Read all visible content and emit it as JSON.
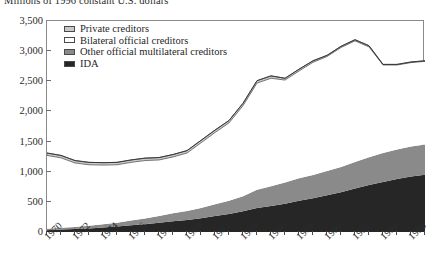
{
  "chart_title": "Millions of 1996 constant U.S. dollars",
  "legend": {
    "items": [
      {
        "label": "Private creditors",
        "color": "#c9c9c9"
      },
      {
        "label": "Bilateral official creditors",
        "color": "#ffffff"
      },
      {
        "label": "Other official multilateral creditors",
        "color": "#8a8a8a"
      },
      {
        "label": "IDA",
        "color": "#262626"
      }
    ]
  },
  "chart_data": {
    "type": "area",
    "stacked": true,
    "title": "Millions of 1996 constant U.S. dollars",
    "xlabel": "",
    "ylabel": "Millions of 1996 constant U.S. dollars",
    "ylim": [
      0,
      3500
    ],
    "ytick_step": 500,
    "grid": false,
    "legend_position": "top-left",
    "xlim": [
      1970,
      1997
    ],
    "x": [
      1970,
      1971,
      1972,
      1973,
      1974,
      1975,
      1976,
      1977,
      1978,
      1979,
      1980,
      1981,
      1982,
      1983,
      1984,
      1985,
      1986,
      1987,
      1988,
      1989,
      1990,
      1991,
      1992,
      1993,
      1994,
      1995,
      1996,
      1997
    ],
    "ytick_labels": [
      "0",
      "500",
      "1,000",
      "1,500",
      "2,000",
      "2,500",
      "3,000",
      "3,500"
    ],
    "ytick_values": [
      0,
      500,
      1000,
      1500,
      2000,
      2500,
      3000,
      3500
    ],
    "xtick_labels": [
      "1970",
      "1972",
      "1974",
      "1976",
      "1978",
      "1980",
      "1982",
      "1984",
      "1986",
      "1988",
      "1990",
      "1992",
      "1994",
      "1996"
    ],
    "xtick_values": [
      1970,
      1972,
      1974,
      1976,
      1978,
      1980,
      1982,
      1984,
      1986,
      1988,
      1990,
      1992,
      1994,
      1996
    ],
    "series": [
      {
        "name": "IDA",
        "color": "#262626",
        "values": [
          30,
          40,
          50,
          60,
          75,
          90,
          110,
          130,
          155,
          180,
          200,
          230,
          265,
          300,
          345,
          400,
          430,
          470,
          520,
          560,
          610,
          660,
          720,
          780,
          830,
          880,
          920,
          950
        ]
      },
      {
        "name": "Other official multilateral creditors",
        "color": "#8a8a8a",
        "values": [
          25,
          30,
          35,
          45,
          55,
          65,
          80,
          95,
          110,
          130,
          150,
          170,
          195,
          220,
          250,
          300,
          330,
          350,
          370,
          385,
          400,
          420,
          440,
          460,
          480,
          490,
          500,
          500
        ]
      },
      {
        "name": "Bilateral official creditors",
        "color": "#ffffff",
        "values": [
          1215,
          1160,
          1060,
          1010,
          980,
          960,
          965,
          960,
          930,
          935,
          960,
          1080,
          1190,
          1290,
          1500,
          1770,
          1790,
          1700,
          1780,
          1870,
          1900,
          1980,
          2010,
          1830,
          1460,
          1400,
          1390,
          1380
        ]
      },
      {
        "name": "Private creditors",
        "color": "#c9c9c9",
        "values": [
          40,
          40,
          40,
          40,
          40,
          40,
          40,
          40,
          40,
          40,
          40,
          40,
          40,
          40,
          40,
          40,
          40,
          30,
          30,
          25,
          20,
          20,
          20,
          20,
          10,
          10,
          10,
          10
        ]
      }
    ],
    "totals": [
      1310,
      1270,
      1185,
      1155,
      1150,
      1155,
      1195,
      1225,
      1235,
      1285,
      1350,
      1520,
      1690,
      1850,
      2135,
      2510,
      2590,
      2550,
      2700,
      2840,
      2930,
      3080,
      3190,
      3090,
      2780,
      2780,
      2820,
      2840
    ]
  }
}
